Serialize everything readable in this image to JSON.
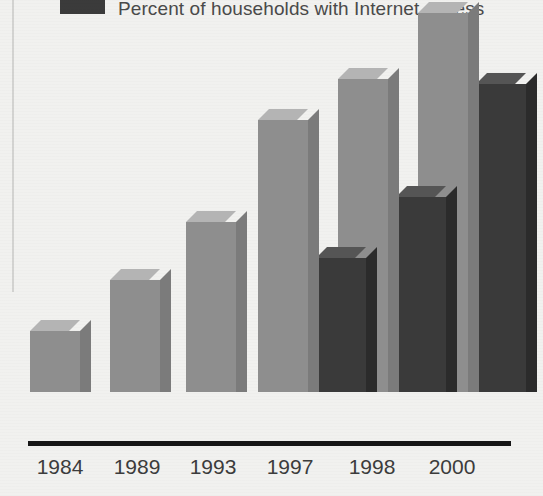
{
  "legend": {
    "swatch_color": "#3b3b3b",
    "label": "Percent of households with Internet access"
  },
  "axis": {
    "baseline_color": "#171717"
  },
  "chart_data": {
    "type": "bar",
    "title": "",
    "subtitle": "",
    "xlabel": "",
    "ylabel": "",
    "ylim": [
      0,
      55
    ],
    "grid": false,
    "legend_position": "top",
    "categories": [
      "1984",
      "1989",
      "1993",
      "1997",
      "1998",
      "2000"
    ],
    "series": [
      {
        "name": "Percent of households with a computer",
        "color": "#8e8e8e",
        "values": [
          8.2,
          15.0,
          22.8,
          36.6,
          42.1,
          51.0
        ],
        "labels": [
          "8.2",
          "15.0",
          "22.8",
          "36.6",
          "42.1",
          "51.0"
        ]
      },
      {
        "name": "Percent of households with Internet access",
        "color": "#3a3a3a",
        "values": [
          null,
          null,
          null,
          18.0,
          26.2,
          41.5
        ],
        "labels": [
          "",
          "",
          "",
          "18.0",
          "26.2",
          "41.5"
        ]
      }
    ]
  },
  "bars": [
    {
      "name": "bar-1984-computer",
      "series": "computer",
      "category": "1984",
      "label": "8.2",
      "x": 30,
      "width": 50,
      "height": 61,
      "label_x": 28,
      "label_y": 360
    },
    {
      "name": "bar-1989-computer",
      "series": "computer",
      "category": "1989",
      "label": "15.0",
      "x": 110,
      "width": 50,
      "height": 112,
      "label_x": 104,
      "label_y": 310
    },
    {
      "name": "bar-1993-computer",
      "series": "computer",
      "category": "1993",
      "label": "22.8",
      "x": 186,
      "width": 50,
      "height": 170,
      "label_x": 180,
      "label_y": 251
    },
    {
      "name": "bar-1997-computer",
      "series": "computer",
      "category": "1997",
      "label": "36.6",
      "x": 258,
      "width": 50,
      "height": 272,
      "label_x": 252,
      "label_y": 149
    },
    {
      "name": "bar-1997-internet",
      "series": "internet",
      "category": "1997",
      "label": "18.0",
      "x": 316,
      "width": 50,
      "height": 134,
      "label_x": 310,
      "label_y": 287
    },
    {
      "name": "bar-1998-computer",
      "series": "computer",
      "category": "1998",
      "label": "42.1",
      "x": 338,
      "width": 50,
      "height": 313,
      "label_x": 332,
      "label_y": 108
    },
    {
      "name": "bar-1998-internet",
      "series": "internet",
      "category": "1998",
      "label": "26.2",
      "x": 396,
      "width": 50,
      "height": 195,
      "label_x": 390,
      "label_y": 226
    },
    {
      "name": "bar-2000-computer",
      "series": "computer",
      "category": "2000",
      "label": "51.0",
      "x": 418,
      "width": 50,
      "height": 379,
      "label_x": 412,
      "label_y": 42
    },
    {
      "name": "bar-2000-internet",
      "series": "internet",
      "category": "2000",
      "label": "41.5",
      "x": 476,
      "width": 50,
      "height": 308,
      "label_x": 470,
      "label_y": 113
    }
  ],
  "ticks": [
    {
      "label": "1984",
      "x": 28,
      "width": 64
    },
    {
      "label": "1989",
      "x": 105,
      "width": 64
    },
    {
      "label": "1993",
      "x": 181,
      "width": 64
    },
    {
      "label": "1997",
      "x": 258,
      "width": 64
    },
    {
      "label": "1998",
      "x": 340,
      "width": 64
    },
    {
      "label": "2000",
      "x": 420,
      "width": 64
    }
  ]
}
